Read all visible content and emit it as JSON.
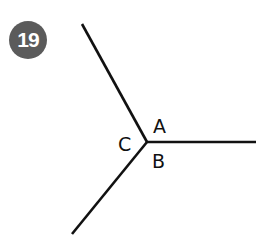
{
  "header": {
    "partial_title": ""
  },
  "problem": {
    "number": "19"
  },
  "diagram": {
    "type": "three-rays-from-point",
    "line_color": "#111111",
    "labels": {
      "A": "A",
      "B": "B",
      "C": "C"
    }
  },
  "colors": {
    "badge_bg": "#5b5b5b",
    "badge_text": "#ffffff"
  }
}
